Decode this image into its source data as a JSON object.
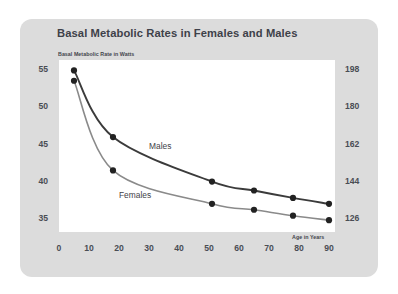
{
  "card": {
    "background_color": "#dcdcdc"
  },
  "chart_data": {
    "type": "line",
    "title": "Basal Metabolic Rates in Females and Males",
    "xlabel": "Age in Years",
    "ylabel": "Basal Metabolic Rate in Watts",
    "xlim": [
      0,
      92
    ],
    "ylim": [
      33.2,
      56.4
    ],
    "grid": false,
    "legend_position": "inline-annotation",
    "x_ticks": [
      "0",
      "10",
      "20",
      "30",
      "40",
      "50",
      "60",
      "70",
      "80",
      "90"
    ],
    "x_tick_values": [
      0,
      10,
      20,
      30,
      40,
      50,
      60,
      70,
      80,
      90
    ],
    "y_ticks_left": [
      "55",
      "50",
      "45",
      "40",
      "35"
    ],
    "y_tick_values_left": [
      55,
      50,
      45,
      40,
      35
    ],
    "y_ticks_right": [
      "198",
      "180",
      "162",
      "144",
      "126"
    ],
    "y_tick_values_right": [
      198,
      180,
      162,
      144,
      126
    ],
    "series": [
      {
        "name": "Males",
        "color": "#3b3b3b",
        "line_width": 1.9,
        "x": [
          5,
          18,
          51,
          65,
          78,
          90
        ],
        "values": [
          55.0,
          46.0,
          40.0,
          38.8,
          37.8,
          37.0
        ]
      },
      {
        "name": "Females",
        "color": "#8a8a8a",
        "line_width": 1.6,
        "x": [
          5,
          18,
          51,
          65,
          78,
          90
        ],
        "values": [
          53.6,
          41.5,
          37.0,
          36.2,
          35.4,
          34.8
        ]
      }
    ],
    "annotations": [
      {
        "text": "Males",
        "x": 30,
        "y": 44.6
      },
      {
        "text": "Females",
        "x": 20,
        "y": 38.0
      }
    ]
  }
}
